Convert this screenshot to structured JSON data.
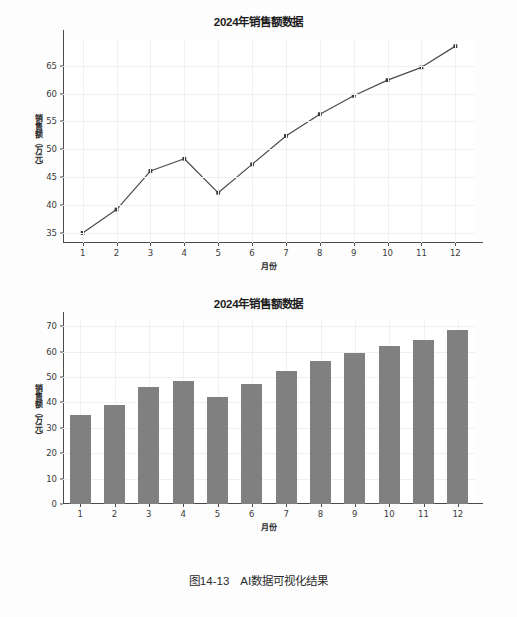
{
  "caption": "图14-13　AI数据可视化结果",
  "colors": {
    "line": "#4a4a4a",
    "marker": "#3a3a3a",
    "bar": "#808080",
    "grid": "#f0f0f0",
    "axis": "#4a4a4a",
    "text": "#222222"
  },
  "chart_data": [
    {
      "type": "line",
      "title": "2024年销售额数据",
      "xlabel": "月份",
      "ylabel": "销售额（万元）",
      "categories": [
        "1",
        "2",
        "3",
        "4",
        "5",
        "6",
        "7",
        "8",
        "9",
        "10",
        "11",
        "12"
      ],
      "x": [
        1,
        2,
        3,
        4,
        5,
        6,
        7,
        8,
        9,
        10,
        11,
        12
      ],
      "values": [
        35.0,
        39.2,
        46.1,
        48.3,
        42.2,
        47.3,
        52.4,
        56.3,
        59.6,
        62.4,
        64.7,
        68.5
      ],
      "yticks": [
        35,
        40,
        45,
        50,
        55,
        60,
        65
      ],
      "ytick_labels": [
        "35",
        "40",
        "45",
        "50",
        "55",
        "60",
        "65"
      ],
      "ylim": [
        33.2,
        69.6
      ],
      "xlim": [
        0.42,
        12.58
      ],
      "grid": true,
      "markers": true,
      "legend": null
    },
    {
      "type": "bar",
      "title": "2024年销售额数据",
      "xlabel": "月份",
      "ylabel": "销售额（万元）",
      "categories": [
        "1",
        "2",
        "3",
        "4",
        "5",
        "6",
        "7",
        "8",
        "9",
        "10",
        "11",
        "12"
      ],
      "values": [
        35.0,
        39.2,
        46.1,
        48.3,
        42.2,
        47.3,
        52.4,
        56.3,
        59.6,
        62.4,
        64.7,
        68.5
      ],
      "yticks": [
        0,
        10,
        20,
        30,
        40,
        50,
        60,
        70
      ],
      "ytick_labels": [
        "0",
        "10",
        "20",
        "30",
        "40",
        "50",
        "60",
        "70"
      ],
      "ylim": [
        0,
        72.5
      ],
      "grid": true,
      "bar_color": "#808080",
      "legend": null
    }
  ]
}
